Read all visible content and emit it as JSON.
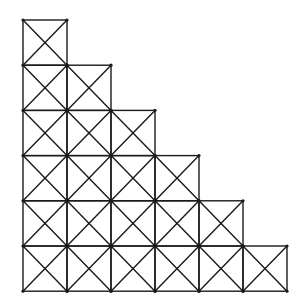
{
  "diagram": {
    "type": "staircase-grid-with-diagonals",
    "columns": 6,
    "rows": 6,
    "column_heights": [
      6,
      5,
      4,
      3,
      2,
      1
    ],
    "origin": {
      "x": 23,
      "y": 20
    },
    "cell_width": 44,
    "cell_height": 45.2,
    "stroke_color": "#1a1a1a",
    "background": "#ffffff",
    "cell_style": "square with both diagonals (X)"
  }
}
